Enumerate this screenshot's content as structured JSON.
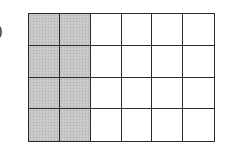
{
  "figure": {
    "label_fragment": ")",
    "grid": {
      "rows": 4,
      "columns": 6,
      "shaded_columns": [
        0,
        1
      ],
      "shaded_cell_count": 8,
      "total_cell_count": 24,
      "shade_color": "#c6c6c6",
      "line_color": "#2a2a2a",
      "background_color": "#ffffff"
    }
  }
}
